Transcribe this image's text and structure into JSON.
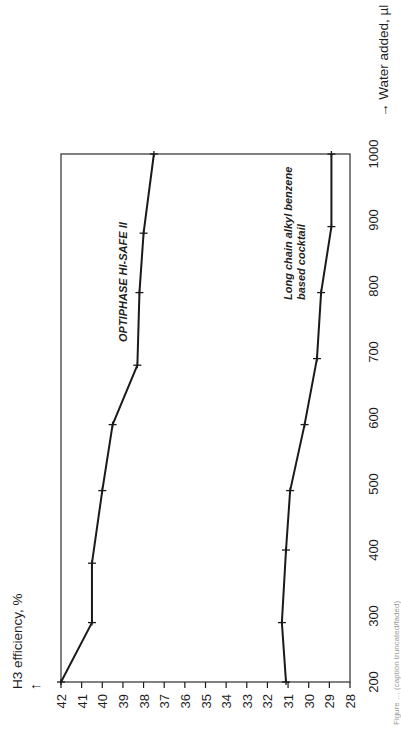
{
  "chart_data": {
    "type": "line",
    "orientation": "rotated-90-ccw",
    "title": "",
    "xlabel": "Water added, µl",
    "ylabel": "H3 efficiency, %",
    "x_axis_label_text": "→ Water added, µl",
    "y_axis_label_text": "H3 efficiency, %",
    "y_axis_arrow": "↑",
    "xlim": [
      200,
      1000
    ],
    "ylim": [
      28,
      42
    ],
    "x_ticks": [
      "200",
      "300",
      "400",
      "500",
      "600",
      "700",
      "800",
      "900",
      "1000"
    ],
    "y_ticks": [
      "42",
      "41",
      "40",
      "39",
      "38",
      "37",
      "36",
      "35",
      "34",
      "33",
      "32",
      "31",
      "30",
      "29",
      "28"
    ],
    "grid": false,
    "legend": "inline labels",
    "series": [
      {
        "name": "OPTIPHASE HI-SAFE II",
        "label_lines": [
          "OPTIPHASE HI-SAFE II"
        ],
        "marker": "+",
        "x": [
          200,
          290,
          380,
          490,
          590,
          680,
          790,
          880,
          1000
        ],
        "values": [
          42.0,
          40.5,
          40.5,
          40.0,
          39.5,
          38.3,
          38.2,
          38.0,
          37.5
        ]
      },
      {
        "name": "Long chain alkyl benzene based cocktail",
        "label_lines": [
          "Long chain alkyl benzene",
          "based cocktail"
        ],
        "marker": "+",
        "x": [
          200,
          290,
          400,
          490,
          590,
          690,
          790,
          890,
          1000
        ],
        "values": [
          31.1,
          31.3,
          31.1,
          30.9,
          30.2,
          29.6,
          29.4,
          28.9,
          28.9
        ]
      }
    ],
    "caption_partial": "Figure … (caption truncated/faded)"
  },
  "colors": {
    "line": "#1a1a1a",
    "frame": "#4a4a4a",
    "background": "#ffffff",
    "caption": "#9a9a9a"
  }
}
